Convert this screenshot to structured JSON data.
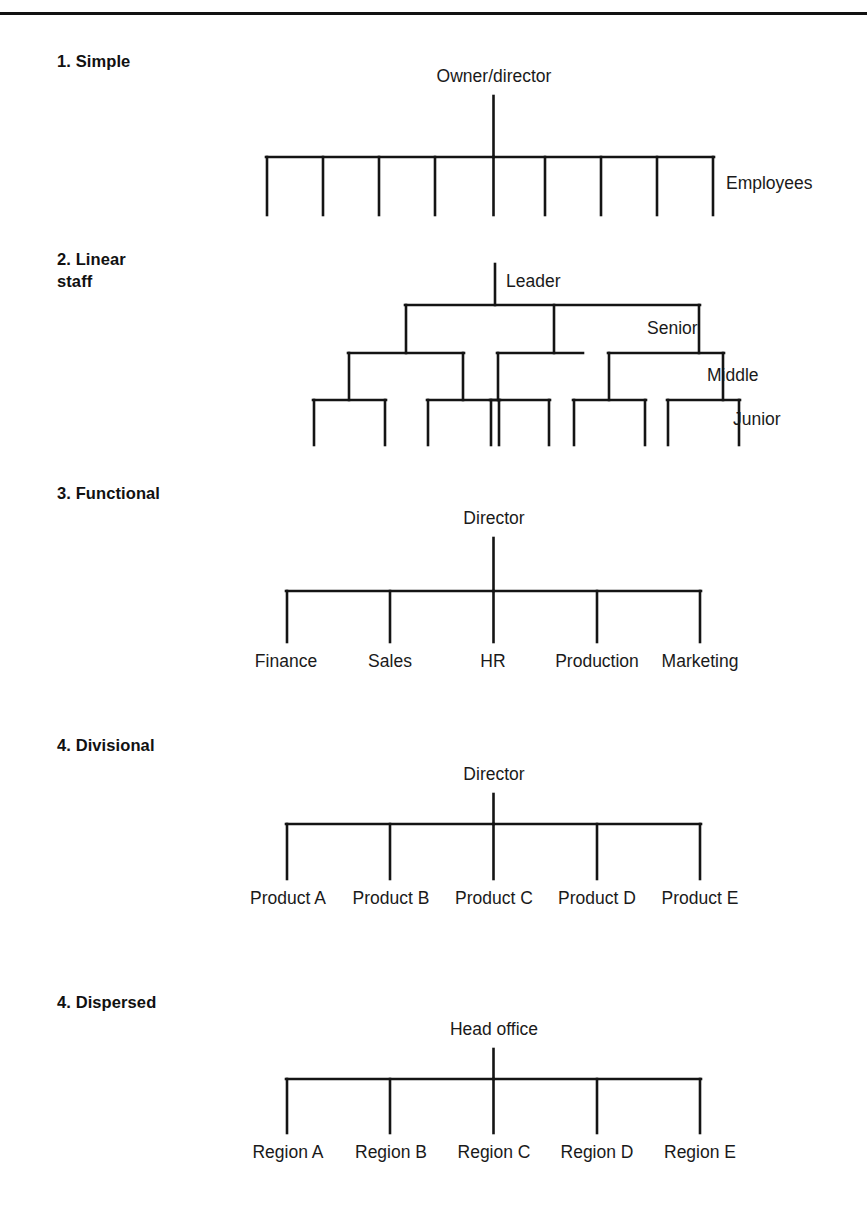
{
  "page": {
    "rule_color": "#111111",
    "line_color": "#141414",
    "background": "#ffffff"
  },
  "sections": [
    {
      "id": "simple",
      "heading": "1. Simple",
      "root_label": "Owner/director",
      "side_label": "Employees",
      "branch_count": 9,
      "branch_labels": []
    },
    {
      "id": "linear-staff",
      "heading": "2. Linear\nstaff",
      "root_label": "Leader",
      "tier_labels": [
        "Senior",
        "Middle",
        "Junior"
      ],
      "senior_count": 3,
      "middle_count": 5,
      "junior_count": 10
    },
    {
      "id": "functional",
      "heading": "3. Functional",
      "root_label": "Director",
      "branch_labels": [
        "Finance",
        "Sales",
        "HR",
        "Production",
        "Marketing"
      ]
    },
    {
      "id": "divisional",
      "heading": "4. Divisional",
      "root_label": "Director",
      "branch_labels": [
        "Product A",
        "Product B",
        "Product C",
        "Product D",
        "Product E"
      ]
    },
    {
      "id": "dispersed",
      "heading": "4. Dispersed",
      "root_label": "Head office",
      "branch_labels": [
        "Region A",
        "Region B",
        "Region C",
        "Region D",
        "Region E"
      ]
    }
  ]
}
